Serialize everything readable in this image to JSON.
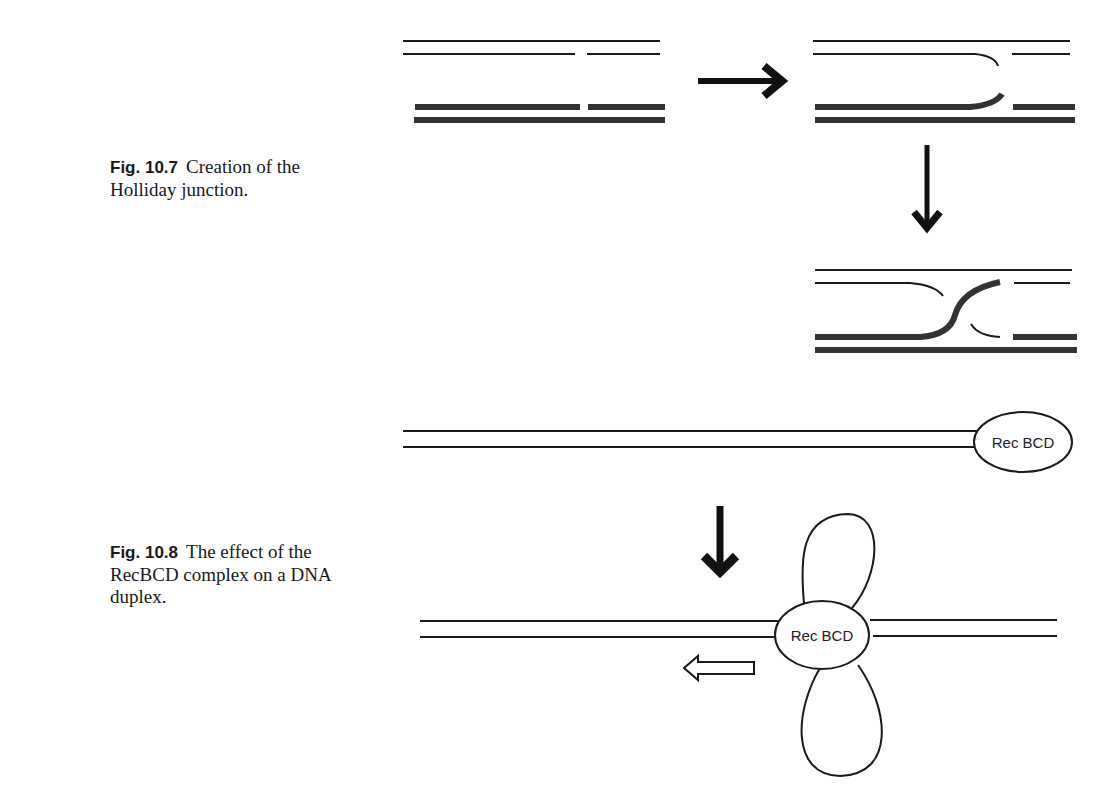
{
  "figures": [
    {
      "number": "Fig. 10.7",
      "caption": "Creation of the Holliday junction.",
      "panels": [
        "nicked duplexes",
        "strand invasion",
        "Holliday junction"
      ]
    },
    {
      "number": "Fig. 10.8",
      "caption": "The effect of the RecBCD complex on a DNA duplex.",
      "labels": {
        "complex_top": "Rec BCD",
        "complex_bottom": "Rec BCD"
      }
    }
  ],
  "colors": {
    "ink": "#1a1a1a",
    "thick_strand": "#333333"
  }
}
